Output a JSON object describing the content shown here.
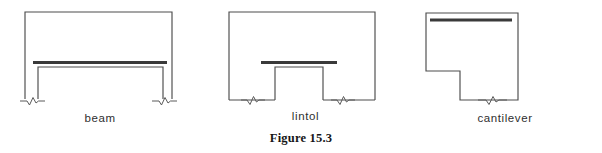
{
  "figure": {
    "caption": "Figure 15.3",
    "background_color": "#ffffff",
    "outline_color": "#4c4c4c",
    "member_color": "#3a3a3a",
    "label_color": "#2f2f2f",
    "caption_color": "#161616"
  },
  "diagrams": [
    {
      "id": "beam",
      "label": "beam",
      "description": "Rectangular wall outline with two piers below a full-span horizontal structural member; break symbols at both base supports.",
      "member_name": "beam-member",
      "supports": 2
    },
    {
      "id": "lintol",
      "label": "lintol",
      "description": "Rectangular wall outline with a central rectangular opening spanned by a short horizontal structural member; break symbols at both base supports.",
      "member_name": "lintol-member",
      "supports": 2
    },
    {
      "id": "cantilever",
      "label": "cantilever",
      "description": "Stepped L-shaped wall outline with a horizontal structural member near the top projecting beyond the support; one break symbol at the base.",
      "member_name": "cantilever-member",
      "supports": 1
    }
  ]
}
